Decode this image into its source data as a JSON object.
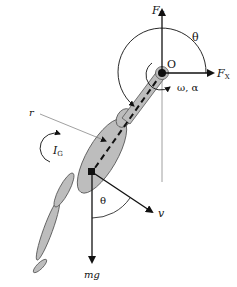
{
  "diagram": {
    "type": "free-body-diagram",
    "labels": {
      "pivot": "O",
      "force_y": "F",
      "force_y_sub": "Y",
      "force_x": "F",
      "force_x_sub": "X",
      "angle_top": "θ",
      "angular": "ω, α",
      "radius": "r",
      "inertia": "I",
      "inertia_sub": "G",
      "velocity": "v",
      "angle_bottom": "θ",
      "weight": "mg"
    },
    "colors": {
      "stroke": "#111111",
      "segment_fill": "#bdbdbd",
      "segment_stroke": "#555555",
      "thin_line": "#777777"
    }
  }
}
